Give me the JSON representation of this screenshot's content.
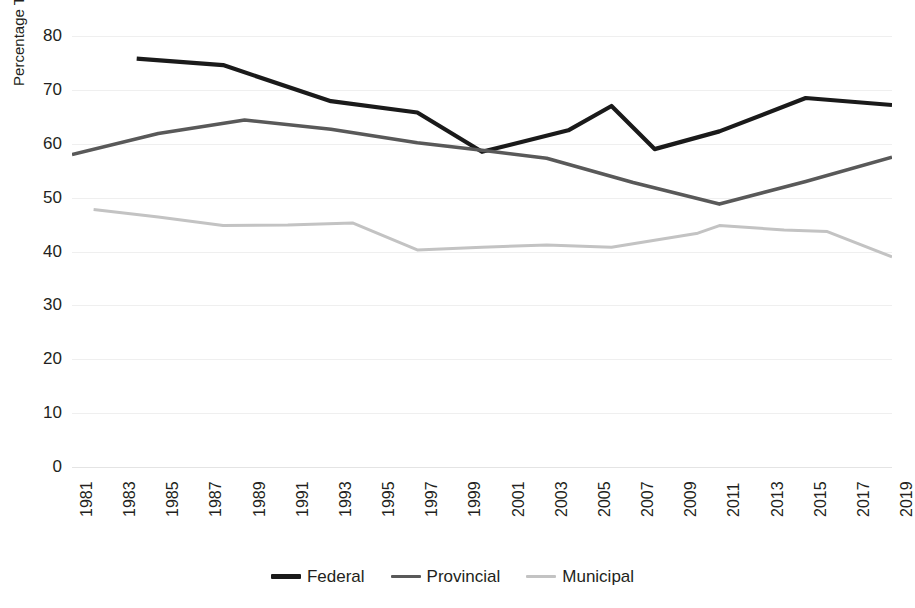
{
  "chart_data": {
    "type": "line",
    "title": "",
    "xlabel": "",
    "ylabel": "Percentage Turnout",
    "xlim": [
      1981,
      2019
    ],
    "ylim": [
      0,
      80
    ],
    "yticks": [
      0,
      10,
      20,
      30,
      40,
      50,
      60,
      70,
      80
    ],
    "xticks": [
      1981,
      1983,
      1985,
      1987,
      1989,
      1991,
      1993,
      1995,
      1997,
      1999,
      2001,
      2003,
      2005,
      2007,
      2009,
      2011,
      2013,
      2015,
      2017,
      2019
    ],
    "grid": true,
    "legend_position": "bottom",
    "series": [
      {
        "name": "Federal",
        "color": "#1a1a1a",
        "points": [
          {
            "x": 1984,
            "y": 75.8
          },
          {
            "x": 1988,
            "y": 74.6
          },
          {
            "x": 1993,
            "y": 67.9
          },
          {
            "x": 1997,
            "y": 65.8
          },
          {
            "x": 2000,
            "y": 58.5
          },
          {
            "x": 2004,
            "y": 62.5
          },
          {
            "x": 2006,
            "y": 67.0
          },
          {
            "x": 2008,
            "y": 59.0
          },
          {
            "x": 2011,
            "y": 62.3
          },
          {
            "x": 2015,
            "y": 68.5
          },
          {
            "x": 2019,
            "y": 67.2
          }
        ]
      },
      {
        "name": "Provincial",
        "color": "#595959",
        "points": [
          {
            "x": 1981,
            "y": 58.0
          },
          {
            "x": 1985,
            "y": 61.9
          },
          {
            "x": 1989,
            "y": 64.4
          },
          {
            "x": 1993,
            "y": 62.7
          },
          {
            "x": 1997,
            "y": 60.2
          },
          {
            "x": 2000,
            "y": 58.8
          },
          {
            "x": 2003,
            "y": 57.3
          },
          {
            "x": 2007,
            "y": 52.8
          },
          {
            "x": 2011,
            "y": 48.8
          },
          {
            "x": 2015,
            "y": 53.0
          },
          {
            "x": 2019,
            "y": 57.5
          }
        ]
      },
      {
        "name": "Municipal",
        "color": "#c3c3c3",
        "points": [
          {
            "x": 1982,
            "y": 47.8
          },
          {
            "x": 1985,
            "y": 46.4
          },
          {
            "x": 1988,
            "y": 44.8
          },
          {
            "x": 1991,
            "y": 44.9
          },
          {
            "x": 1994,
            "y": 45.3
          },
          {
            "x": 1997,
            "y": 40.3
          },
          {
            "x": 2000,
            "y": 40.8
          },
          {
            "x": 2003,
            "y": 41.2
          },
          {
            "x": 2006,
            "y": 40.8
          },
          {
            "x": 2010,
            "y": 43.4
          },
          {
            "x": 2011,
            "y": 44.8
          },
          {
            "x": 2014,
            "y": 44.0
          },
          {
            "x": 2016,
            "y": 43.7
          },
          {
            "x": 2019,
            "y": 39.0
          }
        ]
      }
    ]
  },
  "legend": {
    "items": [
      {
        "label": "Federal",
        "color": "#1a1a1a"
      },
      {
        "label": "Provincial",
        "color": "#595959"
      },
      {
        "label": "Municipal",
        "color": "#c3c3c3"
      }
    ]
  }
}
